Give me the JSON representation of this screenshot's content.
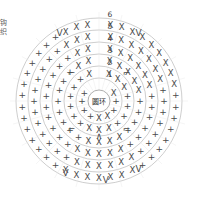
{
  "diagram": {
    "title": "圆环",
    "center_label": "圆环",
    "edge_note": "钩织",
    "background_color": "#ffffff",
    "line_color": "#b9b9b9",
    "symbol_color": "#4a4a4a",
    "text_color": "#3a3a3a"
  },
  "chart_data": {
    "type": "scatter",
    "title": "圆环",
    "subtitle": "",
    "xlabel": "",
    "ylabel": "",
    "grid": true,
    "legend_position": "none",
    "center": {
      "x": 99,
      "y": 101,
      "label": "圆环",
      "radius": 11
    },
    "round_labels": [
      "1",
      "2",
      "3",
      "4",
      "5",
      "6"
    ],
    "rings": [
      {
        "round": "1",
        "radius": 23,
        "symbol": "x",
        "count": 12,
        "label_x": 110,
        "label_y": 74
      },
      {
        "round": "2",
        "radius": 35,
        "symbol": "x",
        "count": 18,
        "label_x": 110,
        "label_y": 62
      },
      {
        "round": "3",
        "radius": 47,
        "symbol": "x",
        "count": 24,
        "label_x": 110,
        "label_y": 50
      },
      {
        "round": "4",
        "radius": 59,
        "symbol": "x",
        "count": 30,
        "label_x": 110,
        "label_y": 38
      },
      {
        "round": "5",
        "radius": 71,
        "symbol": "x",
        "count": 36,
        "label_x": 110,
        "label_y": 26
      },
      {
        "round": "6",
        "radius": 83,
        "symbol": "x",
        "count": 42,
        "label_x": 110,
        "label_y": 14
      }
    ],
    "symbols": {
      "x_stitch": "X",
      "plus_stitch": "+",
      "v_increase": "V",
      "chevron_up": "∧",
      "corner_bracket": "⌐"
    },
    "quadrant_symbols": {
      "upper_left": "+",
      "upper_right": "X",
      "lower_left": "+",
      "lower_right": "+",
      "bottom_center": "X"
    },
    "axis_ranges": {
      "xlim": [
        0,
        198
      ],
      "ylim": [
        0,
        198
      ]
    }
  }
}
